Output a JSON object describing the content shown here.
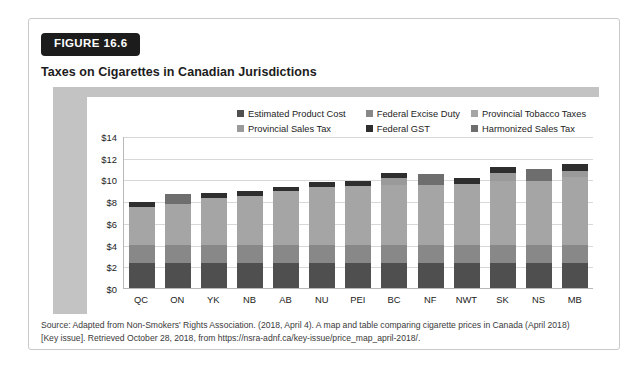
{
  "figure": {
    "badge": "FIGURE 16.6",
    "title": "Taxes on Cigarettes in Canadian Jurisdictions"
  },
  "source": {
    "line1": "Source: Adapted from Non-Smokers' Rights Association. (2018, April 4). A map and table comparing cigarette prices in Canada (April 2018)",
    "line2": "[Key issue]. Retrieved October 28, 2018, from https://nsra-adnf.ca/key-issue/price_map_april-2018/."
  },
  "colors": {
    "estimated_product_cost": "#4f4f4f",
    "federal_excise_duty": "#888888",
    "provincial_tobacco_taxes": "#a5a5a5",
    "provincial_sales_tax": "#9a9a9a",
    "federal_gst": "#2e2e2e",
    "harmonized_sales_tax": "#6e6e6e",
    "frame_band": "#c3c3c3",
    "gridline": "#d8d8d8",
    "badge_bg": "#1c1c1c"
  },
  "chart_data": {
    "type": "bar",
    "stacked": true,
    "title": "Taxes on Cigarettes in Canadian Jurisdictions",
    "xlabel": "",
    "ylabel": "",
    "ylim": [
      0,
      14
    ],
    "yticks": [
      "$0",
      "$2",
      "$4",
      "$6",
      "$8",
      "$10",
      "$12",
      "$14"
    ],
    "ytick_values": [
      0,
      2,
      4,
      6,
      8,
      10,
      12,
      14
    ],
    "grid": true,
    "legend_position": "top",
    "categories": [
      "QC",
      "ON",
      "YK",
      "NB",
      "AB",
      "NU",
      "PEI",
      "BC",
      "NF",
      "NWT",
      "SK",
      "NS",
      "MB"
    ],
    "series": [
      {
        "name": "Estimated Product Cost",
        "color": "#4f4f4f",
        "values": [
          2.3,
          2.3,
          2.3,
          2.3,
          2.3,
          2.3,
          2.3,
          2.3,
          2.3,
          2.3,
          2.3,
          2.3,
          2.3
        ]
      },
      {
        "name": "Federal Excise Duty",
        "color": "#888888",
        "values": [
          1.7,
          1.7,
          1.7,
          1.7,
          1.7,
          1.7,
          1.7,
          1.7,
          1.7,
          1.7,
          1.7,
          1.7,
          1.7
        ]
      },
      {
        "name": "Provincial Tobacco Taxes",
        "color": "#a5a5a5",
        "values": [
          3.5,
          3.7,
          4.3,
          4.5,
          4.9,
          5.3,
          5.4,
          5.5,
          5.5,
          5.6,
          5.9,
          5.9,
          6.2
        ]
      },
      {
        "name": "Provincial Sales Tax",
        "color": "#9a9a9a",
        "values": [
          0.0,
          0.0,
          0.0,
          0.0,
          0.0,
          0.0,
          0.0,
          0.6,
          0.0,
          0.0,
          0.7,
          0.0,
          0.6
        ]
      },
      {
        "name": "Federal GST",
        "color": "#2e2e2e",
        "values": [
          0.4,
          0.0,
          0.45,
          0.45,
          0.45,
          0.5,
          0.5,
          0.5,
          0.0,
          0.55,
          0.55,
          0.0,
          0.6
        ]
      },
      {
        "name": "Harmonized Sales Tax",
        "color": "#6e6e6e",
        "values": [
          0.0,
          1.0,
          0.0,
          0.0,
          0.0,
          0.0,
          0.0,
          0.0,
          1.0,
          0.0,
          0.0,
          1.1,
          0.0
        ]
      }
    ],
    "totals": [
      7.9,
      8.7,
      8.75,
      8.95,
      9.35,
      9.8,
      9.9,
      10.6,
      10.5,
      10.15,
      11.15,
      11.0,
      11.4
    ]
  },
  "legend": {
    "rows": [
      [
        {
          "label": "Estimated Product Cost",
          "color": "#4f4f4f",
          "key": "estimated-product-cost"
        },
        {
          "label": "Federal Excise Duty",
          "color": "#888888",
          "key": "federal-excise-duty"
        },
        {
          "label": "Provincial Tobacco Taxes",
          "color": "#a5a5a5",
          "key": "provincial-tobacco-taxes"
        }
      ],
      [
        {
          "label": "Provincial Sales Tax",
          "color": "#9a9a9a",
          "key": "provincial-sales-tax"
        },
        {
          "label": "Federal GST",
          "color": "#2e2e2e",
          "key": "federal-gst"
        },
        {
          "label": "Harmonized Sales Tax",
          "color": "#6e6e6e",
          "key": "harmonized-sales-tax"
        }
      ]
    ]
  }
}
